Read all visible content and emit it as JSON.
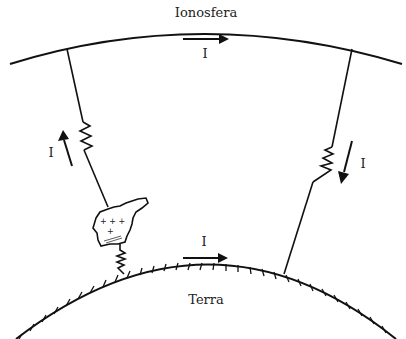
{
  "diagram": {
    "labels": {
      "ionosphere": "Ionosfera",
      "earth": "Terra",
      "current_top": "I",
      "current_left": "I",
      "current_right": "I",
      "current_bottom": "I"
    },
    "cloud_charges": {
      "positive": "+ + + +",
      "negative": "= ="
    },
    "colors": {
      "line": "#111111",
      "background": "#ffffff"
    }
  }
}
